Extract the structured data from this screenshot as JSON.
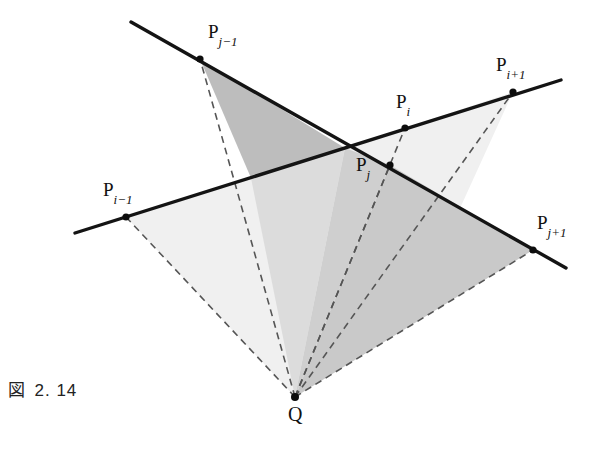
{
  "figure": {
    "caption_symbol": "図",
    "caption_number": "2. 14",
    "background_color": "#ffffff",
    "line_color": "#1a1a1a",
    "dash_color": "#555555",
    "shade_light": "#f0f0f0",
    "shade_medium": "#d6d6d6",
    "shade_dark": "#bdbdbd"
  },
  "points": [
    {
      "id": "P_j_minus_1",
      "label_base": "P",
      "label_sub": "j−1",
      "x": 200,
      "y": 59,
      "label_x": 208,
      "label_y": 22
    },
    {
      "id": "P_i_plus_1",
      "label_base": "P",
      "label_sub": "i+1",
      "x": 513,
      "y": 92,
      "label_x": 496,
      "label_y": 55
    },
    {
      "id": "P_i",
      "label_base": "P",
      "label_sub": "i",
      "x": 405,
      "y": 128,
      "label_x": 396,
      "label_y": 92
    },
    {
      "id": "P_j",
      "label_base": "P",
      "label_sub": "j",
      "x": 390,
      "y": 165,
      "label_x": 356,
      "label_y": 155
    },
    {
      "id": "P_i_minus_1",
      "label_base": "P",
      "label_sub": "i−1",
      "x": 126,
      "y": 217,
      "label_x": 103,
      "label_y": 180
    },
    {
      "id": "P_j_plus_1",
      "label_base": "P",
      "label_sub": "j+1",
      "x": 533,
      "y": 250,
      "label_x": 537,
      "label_y": 213
    },
    {
      "id": "Q",
      "label_base": "Q",
      "label_sub": "",
      "x": 295,
      "y": 397,
      "label_x": 288,
      "label_y": 404
    }
  ],
  "solid_lines": [
    {
      "id": "polyline-j",
      "from_x": 131,
      "from_y": 22,
      "to_x": 566,
      "to_y": 268
    },
    {
      "id": "polyline-i",
      "from_x": 75,
      "from_y": 233,
      "to_x": 561,
      "to_y": 80
    }
  ],
  "dashed_rays": [
    {
      "id": "ray-q-to-Pi-1",
      "to_x": 126,
      "to_y": 217
    },
    {
      "id": "ray-q-to-Pj-1",
      "to_x": 200,
      "to_y": 59
    },
    {
      "id": "ray-q-to-Pi",
      "to_x": 405,
      "to_y": 128
    },
    {
      "id": "ray-q-to-Pj",
      "to_x": 390,
      "to_y": 165
    },
    {
      "id": "ray-q-to-Pi+1",
      "to_x": 513,
      "to_y": 92
    },
    {
      "id": "ray-q-to-Pj+1",
      "to_x": 533,
      "to_y": 250
    }
  ],
  "regions": [
    {
      "id": "wedge-light-left",
      "shade": "#f0f0f0"
    },
    {
      "id": "wedge-dark-upper",
      "shade": "#bdbdbd"
    },
    {
      "id": "wedge-light-right",
      "shade": "#f0f0f0"
    },
    {
      "id": "wedge-medium-right",
      "shade": "#c9c9c9"
    }
  ]
}
